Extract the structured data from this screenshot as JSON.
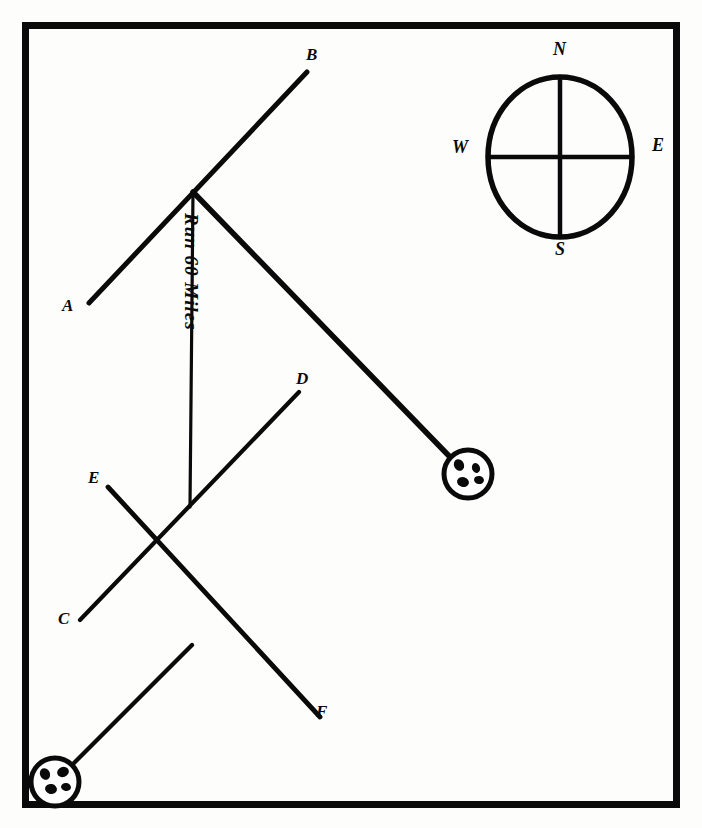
{
  "figure": {
    "kind": "hand-drawn-navigation-diagram",
    "ink_color": "#0a0a0a",
    "paper_color": "#fdfdfc"
  },
  "frame": {
    "name": "border-rectangle",
    "x": 22,
    "y": 22,
    "width": 658,
    "height": 786,
    "stroke_width": 7
  },
  "compass": {
    "name": "compass-rose",
    "center_x": 560,
    "center_y": 157,
    "radius_x": 72,
    "radius_y": 80,
    "labels": {
      "north": "N",
      "south": "S",
      "west": "W",
      "east": "E"
    },
    "label_positions": {
      "north": {
        "x": 553,
        "y": 48
      },
      "south": {
        "x": 555,
        "y": 245
      },
      "west": {
        "x": 452,
        "y": 145
      },
      "east": {
        "x": 652,
        "y": 142
      }
    }
  },
  "points": [
    {
      "id": "A",
      "label": "A",
      "x": 89,
      "y": 303,
      "label_x": 62,
      "label_y": 305
    },
    {
      "id": "B",
      "label": "B",
      "x": 305,
      "y": 72,
      "label_x": 306,
      "label_y": 54
    },
    {
      "id": "C",
      "label": "C",
      "x": 80,
      "y": 620,
      "label_x": 58,
      "label_y": 617
    },
    {
      "id": "D",
      "label": "D",
      "x": 300,
      "y": 390,
      "label_x": 296,
      "label_y": 378
    },
    {
      "id": "E",
      "label": "E",
      "x": 108,
      "y": 487,
      "label_x": 88,
      "label_y": 476
    },
    {
      "id": "F",
      "label": "F",
      "x": 322,
      "y": 719,
      "label_x": 316,
      "label_y": 711
    }
  ],
  "vertex": {
    "name": "route-vertex",
    "x": 193,
    "y": 192
  },
  "lines": [
    {
      "name": "line-a-b",
      "from": "A",
      "to": "B",
      "x1": 89,
      "y1": 303,
      "x2": 307,
      "y2": 72
    },
    {
      "name": "line-vertex-to-station",
      "x1": 193,
      "y1": 192,
      "x2": 451,
      "y2": 458
    },
    {
      "name": "line-run-distance",
      "x1": 193,
      "y1": 192,
      "x2": 190,
      "y2": 507
    },
    {
      "name": "line-c-d",
      "from": "C",
      "to": "D",
      "x1": 80,
      "y1": 620,
      "x2": 299,
      "y2": 392
    },
    {
      "name": "line-e-f",
      "from": "E",
      "to": "F",
      "x1": 108,
      "y1": 487,
      "x2": 320,
      "y2": 717
    },
    {
      "name": "line-station-to-c-d",
      "x1": 70,
      "y1": 767,
      "x2": 192,
      "y2": 645
    }
  ],
  "route_annotation": {
    "name": "run-distance-label",
    "text": "Run 60 Miles",
    "x": 200,
    "y": 212,
    "rotation_deg": 90
  },
  "stations": [
    {
      "name": "station-marker-east",
      "cx": 468,
      "cy": 474,
      "r": 24
    },
    {
      "name": "station-marker-southwest",
      "cx": 55,
      "cy": 782,
      "r": 24
    }
  ]
}
